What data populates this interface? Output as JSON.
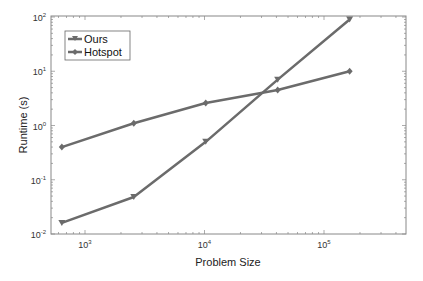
{
  "chart_data": {
    "type": "line",
    "title": "",
    "xlabel": "Problem Size",
    "ylabel": "Runtime (s)",
    "xscale": "log",
    "yscale": "log",
    "xlim": [
      450,
      450000
    ],
    "ylim": [
      0.01,
      100
    ],
    "x_ticks": [
      "10^3",
      "10^4",
      "10^5"
    ],
    "y_ticks": [
      "10^-2",
      "10^-1",
      "10^0",
      "10^1",
      "10^2"
    ],
    "legend_position": "upper left",
    "grid": false,
    "x": [
      640,
      2560,
      10240,
      40960,
      163840
    ],
    "series": [
      {
        "name": "Ours",
        "marker": "triangle-down",
        "values": [
          0.016,
          0.048,
          0.5,
          7,
          90
        ]
      },
      {
        "name": "Hotspot",
        "marker": "diamond",
        "values": [
          0.4,
          1.1,
          2.6,
          4.5,
          10
        ]
      }
    ]
  },
  "axes": {
    "xlabel": "Problem Size",
    "ylabel": "Runtime (s)",
    "x_tick_labels": [
      {
        "base": "10",
        "exp": "3"
      },
      {
        "base": "10",
        "exp": "4"
      },
      {
        "base": "10",
        "exp": "5"
      }
    ],
    "y_tick_labels": [
      {
        "base": "10",
        "exp": "2"
      },
      {
        "base": "10",
        "exp": "1"
      },
      {
        "base": "10",
        "exp": "0"
      },
      {
        "base": "10",
        "exp": "-1"
      },
      {
        "base": "10",
        "exp": "-2"
      }
    ]
  },
  "legend": {
    "items": [
      {
        "label": "Ours"
      },
      {
        "label": "Hotspot"
      }
    ]
  },
  "colors": {
    "line": "#6b6b6b",
    "axis": "#777777"
  }
}
